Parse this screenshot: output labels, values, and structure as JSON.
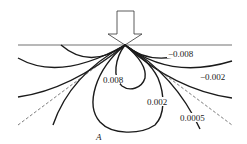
{
  "diagram": {
    "type": "stress contour diagram under point load",
    "load_arrow": "downward-arrow",
    "contour_labels": {
      "neg_inner": "−0.008",
      "neg_outer": "−0.002",
      "pos_inner": "0.008",
      "pos_mid": "0.002",
      "pos_outer": "0.0005"
    },
    "point_label": "A",
    "colors": {
      "line": "#1a1a1a",
      "background": "#ffffff"
    }
  }
}
